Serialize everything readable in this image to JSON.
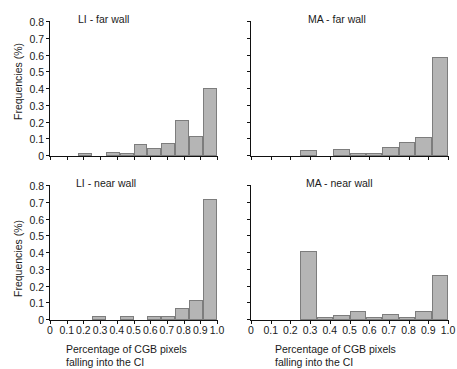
{
  "figure": {
    "axis_titles": {
      "y": "Frequencies (%)",
      "x_line1": "Percentage of CGB pixels",
      "x_line2": "falling into the CI"
    },
    "colors": {
      "bar_fill": "#b5b5b5",
      "bar_edge": "#7d7d7d",
      "axis": "#111111",
      "text": "#1a1a1a",
      "background": "#ffffff"
    },
    "y_ticks": [
      "0",
      "0.1",
      "0.2",
      "0.3",
      "0.4",
      "0.5",
      "0.6",
      "0.7",
      "0.8"
    ],
    "x_ticks": [
      "0",
      "0.1",
      "0.2",
      "0.3",
      "0.4",
      "0.5",
      "0.6",
      "0.7",
      "0.8",
      "0.9",
      "1.0"
    ]
  },
  "chart_data": [
    {
      "id": "li-far-wall",
      "type": "bar",
      "title": "LI - far wall",
      "xlabel": "Percentage of CGB pixels falling into the CI",
      "ylabel": "Frequencies (%)",
      "xlim": [
        0,
        1.0
      ],
      "ylim": [
        0,
        0.8
      ],
      "grid": false,
      "legend": "none",
      "bin_width": 0.1,
      "bin_starts": [
        0.0,
        0.1,
        0.2,
        0.3,
        0.4,
        0.5,
        0.6,
        0.7,
        0.8,
        0.9
      ],
      "categories": [
        "0-0.1",
        "0.1-0.2",
        "0.2-0.3",
        "0.3-0.4",
        "0.4-0.5",
        "0.5-0.6",
        "0.6-0.7",
        "0.7-0.8",
        "0.8-0.9",
        "0.9-1.0"
      ],
      "values": [
        0.0,
        0.0,
        0.02,
        0.0,
        0.022,
        0.02,
        0.072,
        0.048,
        0.075,
        0.215
      ],
      "values_extra": [
        0.12,
        0.405
      ],
      "note": "ten bins across 0-1.0 plus two tall bars near the right edge"
    },
    {
      "id": "ma-far-wall",
      "type": "bar",
      "title": "MA - far wall",
      "xlabel": "Percentage of CGB pixels falling into the CI",
      "ylabel": "Frequencies (%)",
      "xlim": [
        0,
        1.0
      ],
      "ylim": [
        0,
        0.8
      ],
      "grid": false,
      "legend": "none",
      "bin_width": 0.1,
      "bin_starts": [
        0.0,
        0.1,
        0.2,
        0.3,
        0.4,
        0.5,
        0.6,
        0.7,
        0.8,
        0.9
      ],
      "categories": [
        "0-0.1",
        "0.1-0.2",
        "0.2-0.3",
        "0.3-0.4",
        "0.4-0.5",
        "0.5-0.6",
        "0.6-0.7",
        "0.7-0.8",
        "0.8-0.9",
        "0.9-1.0"
      ],
      "values": [
        0.0,
        0.0,
        0.0,
        0.038,
        0.0,
        0.042,
        0.018,
        0.016,
        0.055,
        0.085
      ],
      "values_extra": [
        0.115,
        0.59
      ],
      "note": "tall terminal bar reaching approximately 0.59"
    },
    {
      "id": "li-near-wall",
      "type": "bar",
      "title": "LI - near wall",
      "xlabel": "Percentage of CGB pixels falling into the CI",
      "ylabel": "Frequencies (%)",
      "xlim": [
        0,
        1.0
      ],
      "ylim": [
        0,
        0.8
      ],
      "grid": false,
      "legend": "none",
      "bin_width": 0.1,
      "bin_starts": [
        0.0,
        0.1,
        0.2,
        0.3,
        0.4,
        0.5,
        0.6,
        0.7,
        0.8,
        0.9
      ],
      "categories": [
        "0-0.1",
        "0.1-0.2",
        "0.2-0.3",
        "0.3-0.4",
        "0.4-0.5",
        "0.5-0.6",
        "0.6-0.7",
        "0.7-0.8",
        "0.8-0.9",
        "0.9-1.0"
      ],
      "values": [
        0.0,
        0.0,
        0.0,
        0.022,
        0.0,
        0.022,
        0.0,
        0.022,
        0.022,
        0.072
      ],
      "values_extra": [
        0.12,
        0.72
      ],
      "note": "dominant terminal bar reaching approximately 0.72"
    },
    {
      "id": "ma-near-wall",
      "type": "bar",
      "title": "MA - near wall",
      "xlabel": "Percentage of CGB pixels falling into the CI",
      "ylabel": "Frequencies (%)",
      "xlim": [
        0,
        1.0
      ],
      "ylim": [
        0,
        0.8
      ],
      "grid": false,
      "legend": "none",
      "bin_width": 0.1,
      "bin_starts": [
        0.0,
        0.1,
        0.2,
        0.3,
        0.4,
        0.5,
        0.6,
        0.7,
        0.8,
        0.9
      ],
      "categories": [
        "0-0.1",
        "0.1-0.2",
        "0.2-0.3",
        "0.3-0.4",
        "0.4-0.5",
        "0.5-0.6",
        "0.6-0.7",
        "0.7-0.8",
        "0.8-0.9",
        "0.9-1.0"
      ],
      "values": [
        0.0,
        0.0,
        0.0,
        0.41,
        0.018,
        0.032,
        0.052,
        0.018,
        0.038,
        0.016
      ],
      "values_extra": [
        0.014,
        0.055,
        0.27
      ],
      "note": "bimodal: spike near 0.35-0.4 at 0.41 and terminal bar at 0.27"
    }
  ],
  "panels": {
    "li_far": {
      "title": "LI - far wall",
      "bars": [
        {
          "v": 0.0
        },
        {
          "v": 0.0
        },
        {
          "v": 0.02
        },
        {
          "v": 0.0
        },
        {
          "v": 0.022
        },
        {
          "v": 0.02
        },
        {
          "v": 0.072
        },
        {
          "v": 0.048
        },
        {
          "v": 0.075
        },
        {
          "v": 0.215
        },
        {
          "v": 0.12
        },
        {
          "v": 0.405
        }
      ]
    },
    "ma_far": {
      "title": "MA - far wall",
      "bars": [
        {
          "v": 0.0
        },
        {
          "v": 0.0
        },
        {
          "v": 0.0
        },
        {
          "v": 0.038
        },
        {
          "v": 0.0
        },
        {
          "v": 0.042
        },
        {
          "v": 0.018
        },
        {
          "v": 0.016
        },
        {
          "v": 0.055
        },
        {
          "v": 0.085
        },
        {
          "v": 0.115
        },
        {
          "v": 0.59
        }
      ]
    },
    "li_near": {
      "title": "LI - near wall",
      "bars": [
        {
          "v": 0.0
        },
        {
          "v": 0.0
        },
        {
          "v": 0.0
        },
        {
          "v": 0.022
        },
        {
          "v": 0.0
        },
        {
          "v": 0.022
        },
        {
          "v": 0.0
        },
        {
          "v": 0.022
        },
        {
          "v": 0.022
        },
        {
          "v": 0.072
        },
        {
          "v": 0.12
        },
        {
          "v": 0.72
        }
      ]
    },
    "ma_near": {
      "title": "MA - near wall",
      "bars": [
        {
          "v": 0.0
        },
        {
          "v": 0.0
        },
        {
          "v": 0.0
        },
        {
          "v": 0.41
        },
        {
          "v": 0.018
        },
        {
          "v": 0.032
        },
        {
          "v": 0.052
        },
        {
          "v": 0.018
        },
        {
          "v": 0.038
        },
        {
          "v": 0.016
        },
        {
          "v": 0.055
        },
        {
          "v": 0.27
        }
      ]
    }
  }
}
